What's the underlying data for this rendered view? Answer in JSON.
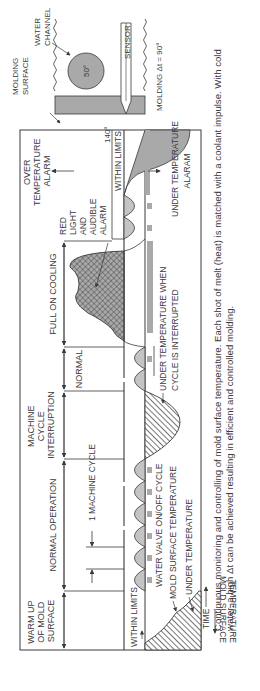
{
  "figure": {
    "orientation": "rotated-90-ccw",
    "caption": "Continuous monitoring and controlling of mold surface temperature. Each shot of melt (heat) is matched with a coolant impulse. With cold water, a high Δt can be achieved resulting in efficient and controlled molding."
  },
  "axes": {
    "y_label_line1": "MOLD SURFACE",
    "y_label_line2": "TEMPERATURE",
    "x_label": "TIME"
  },
  "phases": [
    {
      "id": "warmup",
      "lines": [
        "WARM UP",
        "OF MOLD",
        "SURFACE"
      ]
    },
    {
      "id": "normal-operation",
      "lines": [
        "NORMAL OPERATION"
      ]
    },
    {
      "id": "machine-cycle-interruption",
      "lines": [
        "MACHINE",
        "CYCLE",
        "INTERRUPTION"
      ]
    },
    {
      "id": "normal",
      "lines": [
        "NORMAL"
      ]
    },
    {
      "id": "full-on-cooling",
      "lines": [
        "FULL ON COOLING"
      ]
    },
    {
      "id": "over-temperature-alarm",
      "lines": [
        "OVER",
        "TEMPERATURE",
        "ALARM"
      ]
    }
  ],
  "labels": {
    "one_machine_cycle": "1 MACHINE CYCLE",
    "within_limits": "WITHIN LIMITS",
    "water_valve_cycle": "WATER VALVE ON/OFF CYCLE",
    "mold_surface_temperature": "MOLD SURFACE TEMPERATURE",
    "under_temperature": "UNDER TEMPERATURE",
    "under_temp_interrupted_1": "UNDER TEMPERATURE WHEN",
    "under_temp_interrupted_2": "CYCLE IS INTERRUPTED",
    "red_light_alarm": [
      "RED",
      "LIGHT",
      "AND",
      "AUDIBLE",
      "ALARM"
    ],
    "under_temperature_alarm_1": "UNDER TEMPERATURE",
    "under_temperature_alarm_2": "ALARAM"
  },
  "inset": {
    "water_channel_1": "WATER",
    "water_channel_2": "CHANNEL",
    "water_temp": "50°",
    "sensor": "SENSOR",
    "molding_surface_1": "MOLDING",
    "molding_surface_2": "SURFACE",
    "surface_temp": "140°",
    "delta": "MOLDING Δt = 90°"
  },
  "colors": {
    "line": "#3a3a3a",
    "gray_fill": "#a9a9a9",
    "light_fill": "#c4c4c4",
    "background": "#ffffff"
  }
}
